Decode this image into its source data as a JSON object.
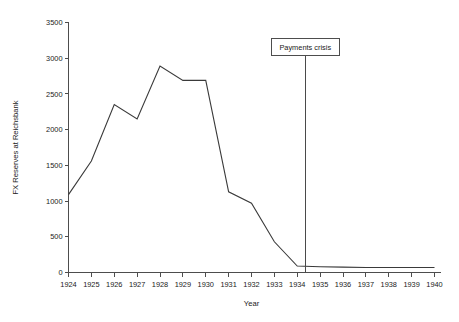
{
  "chart_data": {
    "type": "line",
    "title": "",
    "xlabel": "Year",
    "ylabel": "FX Reserves at Reichsbank",
    "xlim": [
      1924,
      1940
    ],
    "ylim": [
      0,
      3500
    ],
    "grid": false,
    "legend": "none",
    "x": [
      1924,
      1925,
      1926,
      1927,
      1928,
      1929,
      1930,
      1931,
      1932,
      1933,
      1934,
      1935,
      1936,
      1937,
      1938,
      1939,
      1940
    ],
    "values": [
      1090,
      1560,
      2350,
      2150,
      2890,
      2690,
      2690,
      1130,
      970,
      430,
      90,
      80,
      75,
      70,
      70,
      70,
      70
    ],
    "series": [
      {
        "name": "FX Reserves at Reichsbank",
        "values": [
          1090,
          1560,
          2350,
          2150,
          2890,
          2690,
          2690,
          1130,
          970,
          430,
          90,
          80,
          75,
          70,
          70,
          70,
          70
        ]
      }
    ],
    "xticks": [
      "1924",
      "1925",
      "1926",
      "1927",
      "1928",
      "1929",
      "1930",
      "1931",
      "1932",
      "1933",
      "1934",
      "1935",
      "1936",
      "1937",
      "1938",
      "1939",
      "1940"
    ],
    "yticks": [
      "0",
      "500",
      "1000",
      "1500",
      "2000",
      "2500",
      "3000",
      "3500"
    ],
    "ytick_values": [
      0,
      500,
      1000,
      1500,
      2000,
      2500,
      3000,
      3500
    ],
    "annotations": [
      {
        "label": "Payments crisis",
        "x": 1934.35,
        "type": "vertical-marker"
      }
    ],
    "colors": {
      "series_line": "#3a3a3a",
      "axis": "#4d4d4d",
      "event_line": "#4a4a4a",
      "background": "#ffffff",
      "text": "#1a1a1a"
    }
  }
}
